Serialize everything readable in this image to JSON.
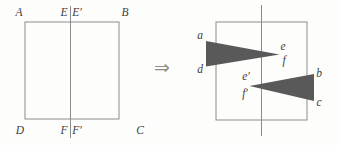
{
  "figure": {
    "arrow_symbol": "⇒",
    "colors": {
      "line": "#8c8c8c",
      "triangle_fill": "#595959",
      "label": "#3d3d3d",
      "background": "#fdfdfc"
    },
    "left_square": {
      "corner_top_left": "A",
      "corner_top_right": "B",
      "corner_bottom_left": "D",
      "corner_bottom_right": "C",
      "fold_top_left": "E",
      "fold_top_right": "E′",
      "fold_bottom_left": "F",
      "fold_bottom_right": "F′"
    },
    "right_square": {
      "upper_flap": {
        "outer_top": "a",
        "outer_bottom": "d",
        "tip_top": "e",
        "tip_bottom": "f"
      },
      "lower_flap": {
        "outer_top": "b",
        "outer_bottom": "c",
        "tip_top": "e′",
        "tip_bottom": "f′"
      }
    }
  }
}
